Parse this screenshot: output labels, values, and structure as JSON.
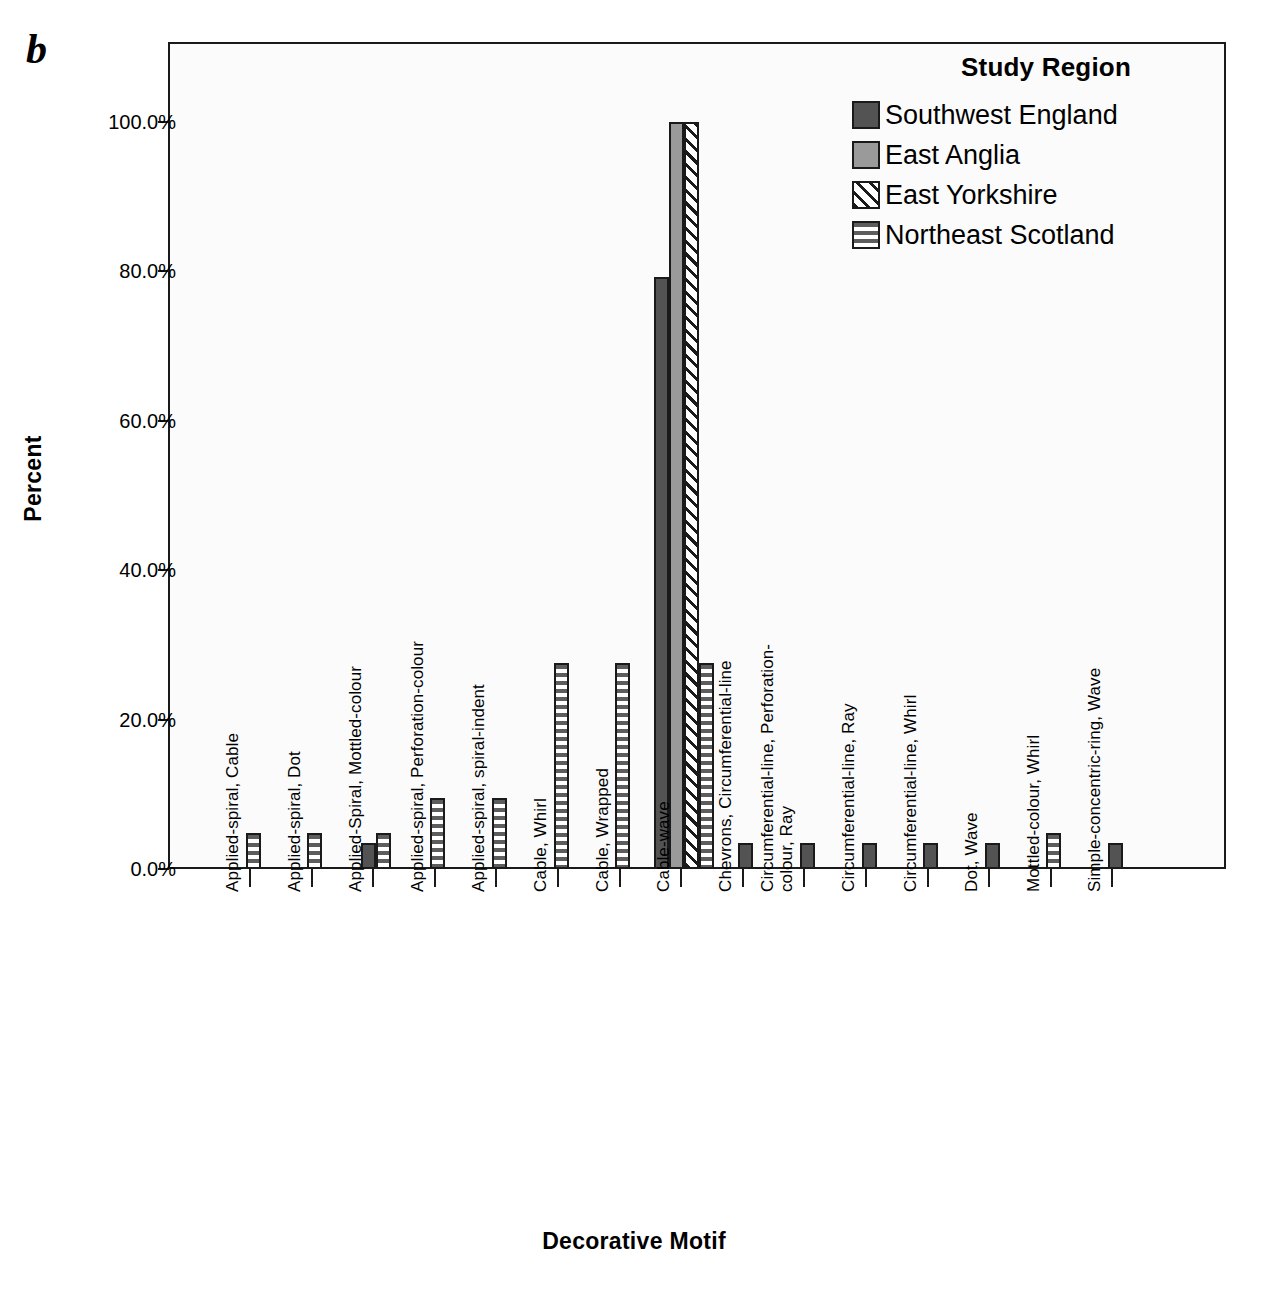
{
  "figure": {
    "panel_letter": "b"
  },
  "chart_data": {
    "type": "bar",
    "title": "",
    "xlabel": "Decorative Motif",
    "ylabel": "Percent",
    "ylim": [
      0,
      108
    ],
    "ytick_values": [
      0,
      20,
      40,
      60,
      80,
      100
    ],
    "ytick_labels": [
      "0.0%",
      "20.0%",
      "40.0%",
      "60.0%",
      "80.0%",
      "100.0%"
    ],
    "grid": false,
    "legend_title": "Study Region",
    "legend_position": "top-right",
    "categories": [
      "Applied-spiral, Cable",
      "Applied-spiral, Dot",
      "Applied-Spiral, Mottled-colour",
      "Applied-spiral, Perforation-colour",
      "Applied-spiral, spiral-indent",
      "Cable, Whirl",
      "Cable, Wrapped",
      "Cable-wave",
      "Chevrons, Circumferential-line",
      "Circumferential-line, Perforation-\ncolour, Ray",
      "Circumferential-line, Ray",
      "Circumferential-line, Whirl",
      "Dot, Wave",
      "Mottled-colour, Whirl",
      "Simple-concentric-ring, Wave"
    ],
    "series": [
      {
        "name": "Southwest England",
        "pattern": "solid-dark-gray",
        "color": "#535353",
        "values": [
          0,
          0,
          3.5,
          0,
          0,
          0,
          0,
          79.2,
          3.5,
          3.5,
          3.5,
          3.5,
          3.5,
          0,
          3.5
        ]
      },
      {
        "name": "East Anglia",
        "pattern": "solid-medium-gray",
        "color": "#9a9a9a",
        "values": [
          0,
          0,
          0,
          0,
          0,
          0,
          0,
          100.0,
          0,
          0,
          0,
          0,
          0,
          0,
          0
        ]
      },
      {
        "name": "East Yorkshire",
        "pattern": "diagonal-hatch",
        "color": "#ffffff",
        "values": [
          0,
          0,
          0,
          0,
          0,
          0,
          0,
          100.0,
          0,
          0,
          0,
          0,
          0,
          0,
          0
        ]
      },
      {
        "name": "Northeast Scotland",
        "pattern": "horizontal-stripes",
        "color": "#ffffff",
        "values": [
          4.8,
          4.8,
          4.8,
          9.5,
          9.5,
          27.6,
          27.6,
          27.6,
          0,
          0,
          0,
          0,
          0,
          4.8,
          0
        ]
      }
    ]
  }
}
